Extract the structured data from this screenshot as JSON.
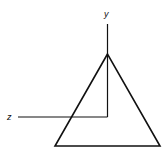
{
  "diagram": {
    "axes": {
      "y_label": "y",
      "z_label": "z"
    },
    "shape": "triangle",
    "colors": {
      "stroke": "#111111",
      "background": "#ffffff"
    }
  }
}
